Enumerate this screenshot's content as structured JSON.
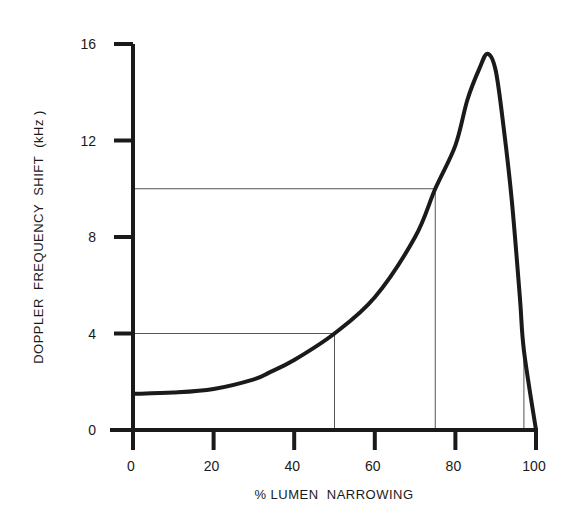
{
  "chart_data": {
    "type": "line",
    "title": "",
    "xlabel": "% LUMEN NARROWING",
    "ylabel": "DOPPLER FREQUENCY SHIFT (kHz)",
    "xlim": [
      0,
      100
    ],
    "ylim": [
      0,
      16
    ],
    "x_ticks": [
      0,
      20,
      40,
      60,
      80,
      100
    ],
    "y_ticks": [
      0,
      4,
      8,
      12,
      16
    ],
    "grid": false,
    "legend": null,
    "series": [
      {
        "name": "Doppler frequency shift",
        "x": [
          0,
          10,
          20,
          30,
          34,
          40,
          50,
          60,
          70,
          75,
          80,
          83,
          86,
          88,
          90,
          92,
          94,
          96,
          97,
          100
        ],
        "y": [
          1.5,
          1.55,
          1.7,
          2.1,
          2.4,
          2.9,
          4.0,
          5.5,
          8.0,
          10.0,
          11.8,
          13.7,
          15.0,
          15.6,
          14.9,
          12.5,
          9.5,
          5.5,
          3.3,
          0
        ]
      }
    ],
    "reference_lines": [
      {
        "x": 50,
        "y": 4,
        "description": "thin guide lines from axes to curve at 50% / 4 kHz"
      },
      {
        "x": 75,
        "y": 10,
        "description": "thin guide lines from axes to curve at 75% / 10 kHz"
      },
      {
        "x": 97,
        "y": 3.3,
        "description": "thin vertical guide line at ~97% up to descending branch"
      }
    ]
  },
  "axes": {
    "x_title": "% LUMEN  NARROWING",
    "y_title": "DOPPLER  FREQUENCY  SHIFT  (kHz )",
    "x_tick_labels": [
      "0",
      "20",
      "40",
      "60",
      "80",
      "100"
    ],
    "y_tick_labels": [
      "0",
      "4",
      "8",
      "12",
      "16"
    ]
  },
  "colors": {
    "curve": "#1a1a1a",
    "axes": "#1a1a1a",
    "guides": "#555555",
    "background": "#ffffff"
  }
}
